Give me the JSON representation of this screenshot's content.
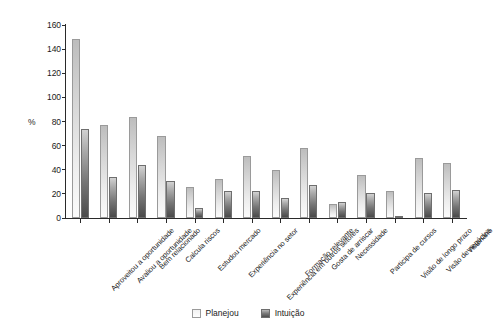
{
  "chart_data": {
    "type": "bar",
    "title": "",
    "xlabel": "",
    "ylabel": "%",
    "ylim": [
      0,
      160
    ],
    "yticks": [
      0,
      20,
      40,
      60,
      80,
      100,
      120,
      140,
      160
    ],
    "grid": false,
    "legend_position": "bottom-center",
    "categories": [
      "Aproveitou a oportunidade",
      "Avaliou a oportunidade",
      "Bem relacionado",
      "Calcula riscos",
      "Estudou mercado",
      "Experiência no setor",
      "Experiência em outros setores",
      "Formação relevante",
      "Gosta de arriscar",
      "Necessidade",
      "Participa de cursos",
      "Visão de longo prazo",
      "Visão de negócios",
      "Visionário"
    ],
    "series": [
      {
        "name": "Planejou",
        "color": "#ededed",
        "values": [
          148,
          77,
          84,
          68,
          26,
          32,
          51,
          40,
          58,
          12,
          36,
          22,
          50,
          46
        ]
      },
      {
        "name": "Intuição",
        "color": "#5a5a5a",
        "values": [
          74,
          34,
          44,
          31,
          8,
          22,
          22,
          17,
          27,
          13,
          21,
          1,
          21,
          23
        ]
      }
    ]
  },
  "axis": {
    "y_title": "%"
  },
  "legend": {
    "items": [
      {
        "label": "Planejou",
        "swatch": "light-gradient-swatch"
      },
      {
        "label": "Intuição",
        "swatch": "dark-gradient-swatch"
      }
    ]
  }
}
